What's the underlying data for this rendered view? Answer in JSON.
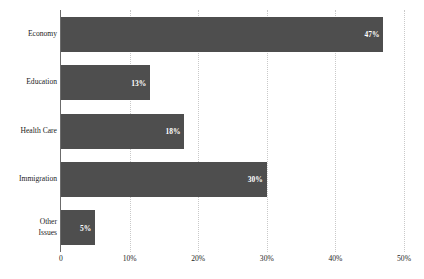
{
  "chart_data": {
    "type": "bar",
    "orientation": "horizontal",
    "title": "",
    "subtitle": "",
    "xlabel": "",
    "ylabel": "",
    "categories": [
      "Economy",
      "Education",
      "Health Care",
      "Immigration",
      "Other Issues"
    ],
    "category_lines": [
      [
        "Economy"
      ],
      [
        "Education"
      ],
      [
        "Health Care"
      ],
      [
        "Immigration"
      ],
      [
        "Other",
        "Issues"
      ]
    ],
    "values": [
      47,
      13,
      18,
      30,
      5
    ],
    "data_labels": [
      "47%",
      "13%",
      "18%",
      "30%",
      "5%"
    ],
    "xlim": [
      0,
      50
    ],
    "xticks": [
      0,
      10,
      20,
      30,
      40,
      50
    ],
    "xticklabels": [
      "0",
      "10%",
      "20%",
      "30%",
      "40%",
      "50%"
    ],
    "grid": "vertical-dotted",
    "legend": "none",
    "bar_color": "#4e4e4e",
    "label_color": "#ffffff",
    "gridline_color": "#c9c9c9",
    "axis_color": "#6b6b6b",
    "background_color": "#ffffff"
  }
}
